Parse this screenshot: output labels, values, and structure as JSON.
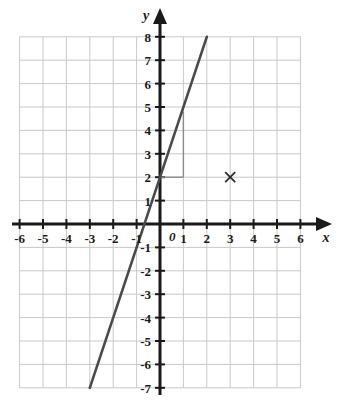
{
  "figure": {
    "kind": "coordinate-plane-graph",
    "background_color": "#ffffff",
    "grid_color": "#c9c9c9",
    "axis_color": "#1a1a1a",
    "line_color": "#4a4a4a",
    "annotation_color": "#8a8a8a",
    "mark_color": "#2b2b2b"
  },
  "axes": {
    "x_label": "x",
    "y_label": "y",
    "origin_label": "0",
    "x_min": -6,
    "x_max": 6,
    "y_min": -7,
    "y_max": 8,
    "x_tick_labels": [
      "-6",
      "-5",
      "-4",
      "-3",
      "-2",
      "-1",
      "1",
      "2",
      "3",
      "4",
      "5",
      "6"
    ],
    "x_tick_values": [
      -6,
      -5,
      -4,
      -3,
      -2,
      -1,
      1,
      2,
      3,
      4,
      5,
      6
    ],
    "y_tick_labels": [
      "8",
      "7",
      "6",
      "5",
      "4",
      "3",
      "2",
      "1",
      "-1",
      "-2",
      "-3",
      "-4",
      "-5",
      "-6",
      "-7"
    ],
    "y_tick_values": [
      8,
      7,
      6,
      5,
      4,
      3,
      2,
      1,
      -1,
      -2,
      -3,
      -4,
      -5,
      -6,
      -7
    ]
  },
  "chart_data": {
    "type": "line",
    "title": "",
    "xlabel": "x",
    "ylabel": "y",
    "xlim": [
      -6,
      6
    ],
    "ylim": [
      -7,
      8
    ],
    "grid": true,
    "legend": "none",
    "series": [
      {
        "name": "plotted-line",
        "equation": "y = 3x + 2",
        "slope": 3,
        "y_intercept": 2,
        "x": [
          -3,
          2
        ],
        "y": [
          -7,
          8
        ],
        "color": "#4a4a4a"
      }
    ],
    "points": [
      {
        "name": "x-mark",
        "marker": "x",
        "x": 3,
        "y": 2,
        "label": "",
        "color": "#2b2b2b"
      }
    ],
    "annotations": [
      {
        "name": "slope-triangle-run",
        "type": "segment",
        "from": [
          0,
          2
        ],
        "to": [
          1,
          2
        ],
        "color": "#8a8a8a"
      },
      {
        "name": "slope-triangle-rise",
        "type": "segment",
        "from": [
          1,
          2
        ],
        "to": [
          1,
          4.8
        ],
        "color": "#8a8a8a"
      }
    ]
  }
}
